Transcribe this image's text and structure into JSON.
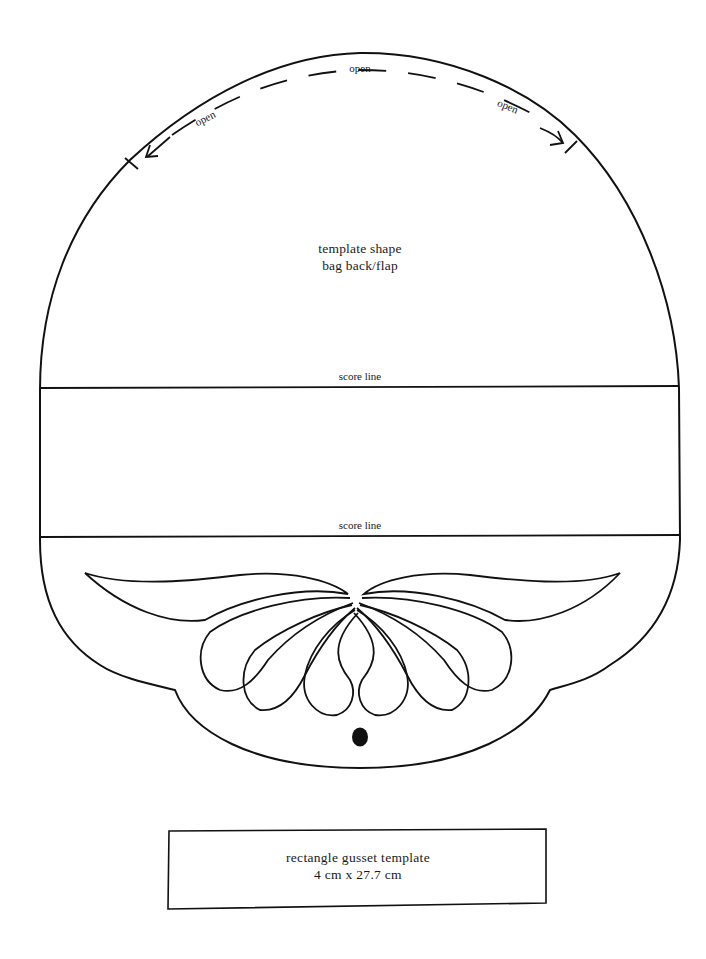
{
  "template": {
    "title_line1": "template shape",
    "title_line2": "bag back/flap",
    "opening_labels": {
      "top": "open",
      "left": "open",
      "right": "open"
    },
    "score_lines": [
      {
        "label": "score line"
      },
      {
        "label": "score line"
      }
    ],
    "closure_hole": "black dot"
  },
  "gusset": {
    "title": "rectangle gusset template",
    "dimensions": "4 cm x 27.7 cm"
  },
  "colors": {
    "line": "#111111",
    "background": "#ffffff"
  }
}
